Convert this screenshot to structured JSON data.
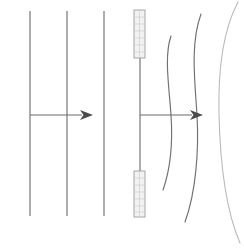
{
  "figure": {
    "background_color": "#ffffff",
    "line_color": "#6f7072",
    "arrow_color": "#4a4b4d",
    "plate_fill_color": "#f2f2f3",
    "plate_border_color": "#9b9c9e",
    "faint_line_color": "#b9babc",
    "width": 244,
    "height": 250
  },
  "panels": [
    {
      "id": "left-panel",
      "name": "uniform-field-panel",
      "description": "Straight parallel vertical field lines with a horizontal direction arrow",
      "field_lines": [
        {
          "name": "field-line-1",
          "x": 30,
          "y_top": 11,
          "y_bottom": 216
        },
        {
          "name": "field-line-2",
          "x": 67,
          "y_top": 11,
          "y_bottom": 216
        },
        {
          "name": "field-line-3",
          "x": 104,
          "y_top": 11,
          "y_bottom": 216
        }
      ],
      "arrow": {
        "name": "direction-arrow-left",
        "x_start": 30,
        "x_tip": 93,
        "y": 115,
        "head_length": 13,
        "head_half_width": 5
      }
    },
    {
      "id": "right-panel",
      "name": "distorted-field-panel",
      "description": "Vertical field line interrupted by two hatched plates, with outward bowing curved field lines and a horizontal direction arrow",
      "center_line": {
        "name": "center-field-line",
        "x": 140,
        "y_top": 57,
        "y_bottom": 172
      },
      "plates": [
        {
          "name": "plate-upper",
          "x": 134,
          "y": 10,
          "width": 11,
          "height": 48,
          "hatch_count": 7
        },
        {
          "name": "plate-lower",
          "x": 134,
          "y": 171,
          "width": 11,
          "height": 46,
          "hatch_count": 7
        }
      ],
      "arrow": {
        "name": "direction-arrow-right",
        "x_start": 140,
        "x_tip": 203,
        "y": 115,
        "head_length": 13,
        "head_half_width": 5
      },
      "curved_field_lines": [
        {
          "name": "curved-field-line-1",
          "path": "M 171,36 C 164,56 169,86 171,115 C 173,144 170,170 163,190",
          "faint": false
        },
        {
          "name": "curved-field-line-2",
          "path": "M 201,14 C 190,44 195,82 197,115 C 199,150 196,192 185,222",
          "faint": false
        },
        {
          "name": "curved-field-line-3",
          "path": "M 238,2 C 222,32 218,76 219,115 C 220,156 224,206 240,243",
          "faint": true
        }
      ]
    }
  ]
}
